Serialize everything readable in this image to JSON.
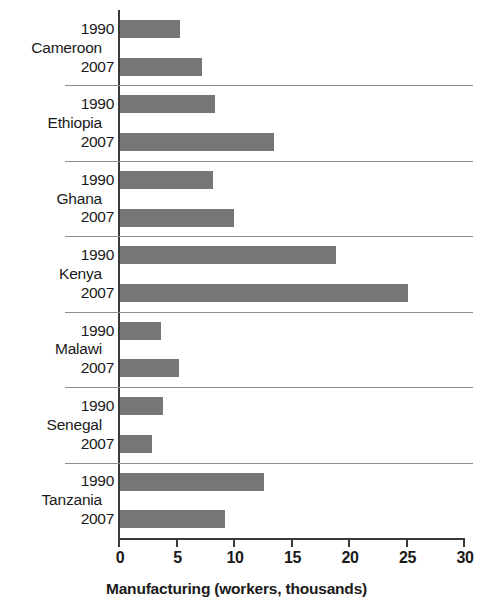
{
  "chart_data": {
    "type": "bar",
    "orientation": "horizontal",
    "title": "",
    "xlabel": "Manufacturing (workers, thousands)",
    "ylabel": "",
    "xlim": [
      0,
      30
    ],
    "xticks": [
      0,
      5,
      10,
      15,
      20,
      25,
      30
    ],
    "xtick_labels": [
      "0",
      "5",
      "10",
      "15",
      "20",
      "25",
      "30"
    ],
    "grid": false,
    "legend": false,
    "bar_color": "#767676",
    "axis_color": "#3a3a3a",
    "categories": [
      "Cameroon",
      "Ethiopia",
      "Ghana",
      "Kenya",
      "Malawi",
      "Senegal",
      "Tanzania"
    ],
    "subcategories": [
      "1990",
      "2007"
    ],
    "series": [
      {
        "name": "1990",
        "values": [
          5.2,
          8.3,
          8.1,
          18.8,
          3.6,
          3.7,
          12.5
        ]
      },
      {
        "name": "2007",
        "values": [
          7.1,
          13.4,
          9.9,
          25.0,
          5.1,
          2.8,
          9.1
        ]
      }
    ],
    "groups": [
      {
        "label": "Cameroon",
        "bars": [
          {
            "year": "1990",
            "value": 5.2
          },
          {
            "year": "2007",
            "value": 7.1
          }
        ]
      },
      {
        "label": "Ethiopia",
        "bars": [
          {
            "year": "1990",
            "value": 8.3
          },
          {
            "year": "2007",
            "value": 13.4
          }
        ]
      },
      {
        "label": "Ghana",
        "bars": [
          {
            "year": "1990",
            "value": 8.1
          },
          {
            "year": "2007",
            "value": 9.9
          }
        ]
      },
      {
        "label": "Kenya",
        "bars": [
          {
            "year": "1990",
            "value": 18.8
          },
          {
            "year": "2007",
            "value": 25.0
          }
        ]
      },
      {
        "label": "Malawi",
        "bars": [
          {
            "year": "1990",
            "value": 3.6
          },
          {
            "year": "2007",
            "value": 5.1
          }
        ]
      },
      {
        "label": "Senegal",
        "bars": [
          {
            "year": "1990",
            "value": 3.7
          },
          {
            "year": "2007",
            "value": 2.8
          }
        ]
      },
      {
        "label": "Tanzania",
        "bars": [
          {
            "year": "1990",
            "value": 12.5
          },
          {
            "year": "2007",
            "value": 9.1
          }
        ]
      }
    ]
  }
}
